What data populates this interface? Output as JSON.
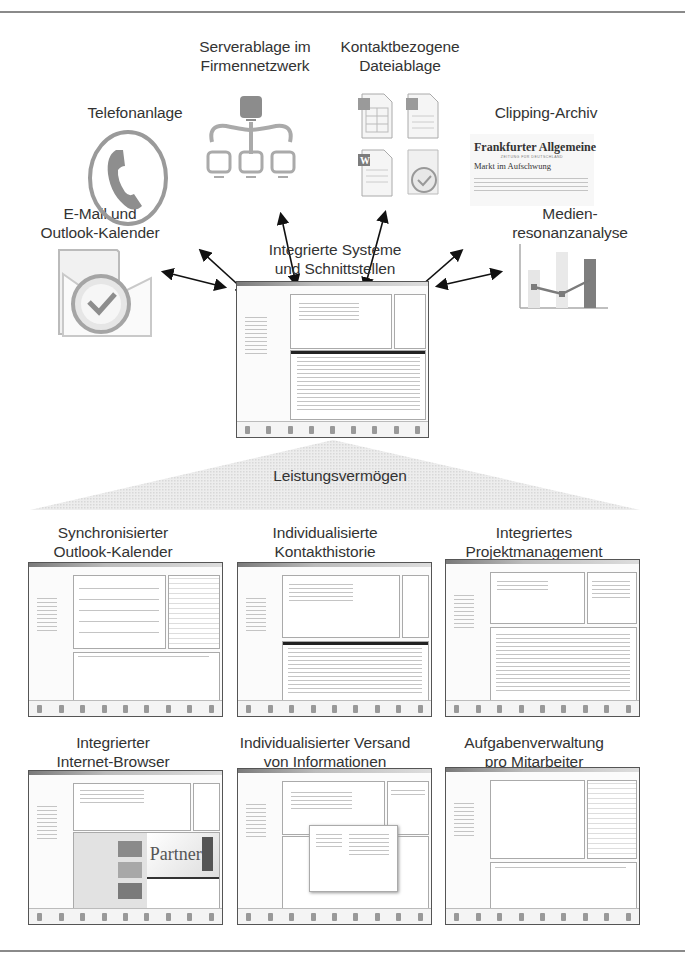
{
  "hub": {
    "title_line1": "Integrierte Systeme",
    "title_line2": "und Schnittstellen"
  },
  "sources": [
    {
      "id": "telefonanlage",
      "line1": "Telefonanlage",
      "line2": "",
      "icon": "phone-icon"
    },
    {
      "id": "serverablage",
      "line1": "Serverablage im",
      "line2": "Firmennetzwerk",
      "icon": "network-icon"
    },
    {
      "id": "dateiablage",
      "line1": "Kontaktbezogene",
      "line2": "Dateiablage",
      "icon": "office-files-icon"
    },
    {
      "id": "clipping",
      "line1": "Clipping-Archiv",
      "line2": "",
      "icon": "newspaper-clipping-icon"
    },
    {
      "id": "email",
      "line1": "E-Mail und",
      "line2": "Outlook-Kalender",
      "icon": "outlook-icon"
    },
    {
      "id": "medienresonanz",
      "line1": "Medien-",
      "line2": "resonanzanalyse",
      "icon": "bar-chart-icon"
    }
  ],
  "newspaper": {
    "masthead": "Frankfurter Allgemeine",
    "subline": "ZEITUNG FÜR DEUTSCHLAND",
    "headline": "Markt im Aufschwung"
  },
  "capability": {
    "label": "Leistungsvermögen"
  },
  "features": [
    {
      "line1": "Synchronisierter",
      "line2": "Outlook-Kalender",
      "kind": "calendar"
    },
    {
      "line1": "Individualisierte",
      "line2": "Kontakthistorie",
      "kind": "contact"
    },
    {
      "line1": "Integriertes",
      "line2": "Projektmanagement",
      "kind": "project"
    },
    {
      "line1": "Integrierter",
      "line2": "Internet-Browser",
      "kind": "browser"
    },
    {
      "line1": "Individualisierter Versand",
      "line2": "von Informationen",
      "kind": "mailing"
    },
    {
      "line1": "Aufgabenverwaltung",
      "line2": "pro Mitarbeiter",
      "kind": "tasks"
    }
  ],
  "browser_shot": {
    "banner_text": "Partner"
  },
  "colors": {
    "rule": "#8a8a8a",
    "icon_gray": "#9a9a9a",
    "dark_gray": "#6e6e6e",
    "arrow": "#111111",
    "pyramid": "#e4e4e4"
  }
}
